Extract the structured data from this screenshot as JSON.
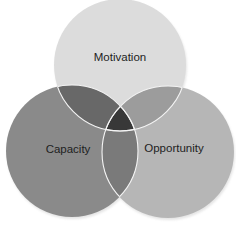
{
  "diagram": {
    "type": "venn",
    "sets": [
      {
        "id": "motivation",
        "label": "Motivation",
        "color": "#dcdcdc",
        "cx": 120,
        "cy": 65,
        "r": 66,
        "label_x": 120,
        "label_y": 58
      },
      {
        "id": "capacity",
        "label": "Capacity",
        "color": "#8a8a8a",
        "cx": 72,
        "cy": 151,
        "r": 66,
        "label_x": 68,
        "label_y": 150
      },
      {
        "id": "opportunity",
        "label": "Opportunity",
        "color": "#b6b6b6",
        "cx": 168,
        "cy": 152,
        "r": 66,
        "label_x": 174,
        "label_y": 149
      }
    ],
    "overlaps": {
      "motivation_capacity": "#686868",
      "motivation_opportunity": "#9c9c9c",
      "capacity_opportunity": "#7a7a7a",
      "all_three": "#383838"
    },
    "outline_color": "#f4f4f4",
    "background": "#ffffff"
  }
}
